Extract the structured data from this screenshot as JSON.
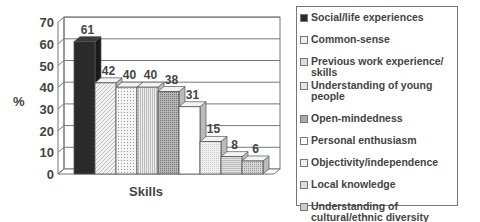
{
  "chart_data": {
    "type": "bar",
    "style": "3d-clustered",
    "title": "",
    "xlabel": "Skills",
    "ylabel": "%",
    "ylim": [
      0,
      70
    ],
    "yticks": [
      0,
      10,
      20,
      30,
      40,
      50,
      60,
      70
    ],
    "grid": true,
    "legend_position": "right",
    "categories": [
      "Skills"
    ],
    "series": [
      {
        "name": "Social/life experiences",
        "values": [
          61
        ],
        "fill": "#2a2a2a",
        "pattern": "solid"
      },
      {
        "name": "Common-sense",
        "values": [
          42
        ],
        "fill": "#e8e8e8",
        "pattern": "diagonal"
      },
      {
        "name": "Previous work experience/ skills",
        "values": [
          40
        ],
        "fill": "#ececec",
        "pattern": "dots"
      },
      {
        "name": "Understanding of young people",
        "values": [
          40
        ],
        "fill": "#e2e2e2",
        "pattern": "vertical"
      },
      {
        "name": "Open-mindedness",
        "values": [
          38
        ],
        "fill": "#9a9a9a",
        "pattern": "grid"
      },
      {
        "name": "Personal enthusiasm",
        "values": [
          31
        ],
        "fill": "#ffffff",
        "pattern": "none"
      },
      {
        "name": "Objectivity/independence",
        "values": [
          15
        ],
        "fill": "#eeeeee",
        "pattern": "fine-dots"
      },
      {
        "name": "Local knowledge",
        "values": [
          8
        ],
        "fill": "#d8d8d8",
        "pattern": "horizontal"
      },
      {
        "name": "Understanding of cultural/ethnic diversity",
        "values": [
          6
        ],
        "fill": "#cfcfcf",
        "pattern": "dense-dots"
      }
    ]
  },
  "legend": {
    "items": [
      {
        "label_lines": [
          "Social/life experiences"
        ]
      },
      {
        "label_lines": [
          "Common-sense"
        ]
      },
      {
        "label_lines": [
          "Previous work experience/",
          "skills"
        ]
      },
      {
        "label_lines": [
          "Understanding of young people"
        ]
      },
      {
        "label_lines": [
          "Open-mindedness"
        ]
      },
      {
        "label_lines": [
          "Personal enthusiasm"
        ]
      },
      {
        "label_lines": [
          "Objectivity/independence"
        ]
      },
      {
        "label_lines": [
          "Local knowledge"
        ]
      },
      {
        "label_lines": [
          "Understanding of",
          "cultural/ethnic diversity"
        ]
      }
    ]
  }
}
